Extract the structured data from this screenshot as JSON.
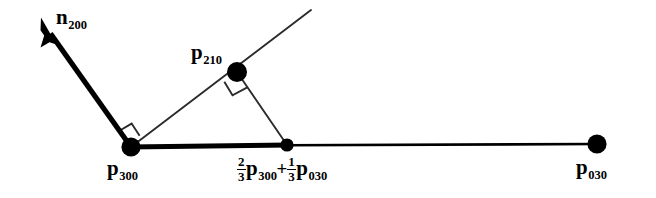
{
  "figure": {
    "width": 656,
    "height": 198,
    "background_color": "#ffffff",
    "stroke_color": "#000000"
  },
  "labels": {
    "normal_vector": {
      "base": "n",
      "sub": "200"
    },
    "point_p210": {
      "base": "p",
      "sub": "210"
    },
    "point_p300": {
      "base": "p",
      "sub": "300"
    },
    "point_p030": {
      "base": "p",
      "sub": "030"
    },
    "midpoint": {
      "frac1_num": "2",
      "frac1_den": "3",
      "base1": "p",
      "sub1": "300",
      "operator": "+",
      "frac2_num": "1",
      "frac2_den": "3",
      "base2": "p",
      "sub2": "030"
    }
  },
  "geometry": {
    "points": [
      {
        "name": "p300",
        "x": 131,
        "y": 147,
        "r": 9.5
      },
      {
        "name": "midpoint",
        "x": 287,
        "y": 145,
        "r": 6.5
      },
      {
        "name": "p030",
        "x": 597,
        "y": 144,
        "r": 9.5
      },
      {
        "name": "p210",
        "x": 237,
        "y": 72,
        "r": 10
      }
    ],
    "baseline_thick": {
      "x1": 131,
      "y1": 147,
      "x2": 287,
      "y2": 145,
      "width": 5
    },
    "baseline_thin": {
      "x1": 287,
      "y1": 145,
      "x2": 597,
      "y2": 144,
      "width": 2.4
    },
    "normal_arrow": {
      "x1": 131,
      "y1": 147,
      "x2": 41,
      "y2": 21,
      "width": 5.2
    },
    "ray_through_p210": {
      "x1": 131,
      "y1": 147,
      "x2": 311,
      "y2": 10,
      "width": 1.9
    },
    "segment_p210_mid": {
      "x1": 237,
      "y1": 72,
      "x2": 287,
      "y2": 145,
      "width": 1.9
    },
    "right_angle_markers": [
      {
        "at": "p300",
        "size": 17
      },
      {
        "at": "p210",
        "size": 19
      }
    ]
  }
}
